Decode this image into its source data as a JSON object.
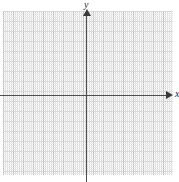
{
  "figure": {
    "kind": "cartesian-coordinate-grid",
    "width": 179,
    "height": 182,
    "background_color": "#ffffff"
  },
  "axes": {
    "x_label": "x",
    "y_label": "y",
    "axis_color": "#4d4d4d",
    "arrow_color": "#3a3a3a",
    "x_axis_y_px": 95,
    "y_axis_x_px": 86,
    "x_arrow_direction": "right",
    "y_arrow_direction": "up"
  },
  "grid": {
    "major_color": "#b9b9b9",
    "minor_color": "#dcdcdc",
    "major_spacing_px": 10,
    "minor_spacing_px": 2,
    "minor_per_major": 5,
    "columns": 17,
    "rows": 16,
    "left_px": 3,
    "top_px": 11,
    "width_px": 170,
    "height_px": 164,
    "style": "dotted-minor-solid-major"
  },
  "chart_data": {
    "type": "scatter",
    "title": "",
    "subtitle": "",
    "xlabel": "x",
    "ylabel": "y",
    "xlim": [
      -8.3,
      8.7
    ],
    "ylim": [
      -7.9,
      8.4
    ],
    "x_major_step": 1,
    "y_major_step": 1,
    "x_minor_step": 0.2,
    "y_minor_step": 0.2,
    "xticks": [],
    "yticks": [],
    "xticklabels": [],
    "yticklabels": [],
    "grid": true,
    "legend": null,
    "legend_position": "none",
    "annotations": [],
    "series": [
      {
        "name": "",
        "x": [],
        "y": []
      }
    ],
    "note": "Empty coordinate plane — no plotted data points, curves, or tick number labels are rendered."
  }
}
